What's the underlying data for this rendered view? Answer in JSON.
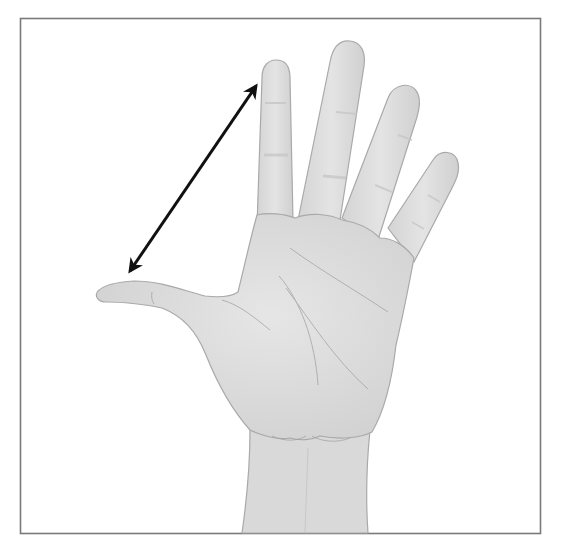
{
  "figure": {
    "annotation": "Double-headed arrow spanning from thumb tip to index fingertip",
    "measurement": "hand span (thumb tip to index fingertip)",
    "colors": {
      "background": "#ffffff",
      "frame": "#7a7a7a",
      "skin_fill": "#dcdcdc",
      "skin_highlight": "#e8e8e8",
      "skin_outline": "#a9a9a9",
      "crease": "#9a9a9a",
      "arrow": "#111111"
    }
  }
}
